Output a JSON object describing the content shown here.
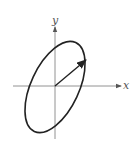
{
  "diagram": {
    "type": "ellipse-with-vector",
    "axes": {
      "x_label": "x",
      "y_label": "y"
    },
    "shapes": [
      {
        "kind": "ellipse",
        "description": "tilted ellipse centered at origin, major axis along positive slope"
      },
      {
        "kind": "vector",
        "description": "arrow from origin to ellipse boundary in the first quadrant"
      }
    ],
    "colors": {
      "stroke": "#222222",
      "axis": "#666666",
      "background": "#ffffff"
    }
  }
}
